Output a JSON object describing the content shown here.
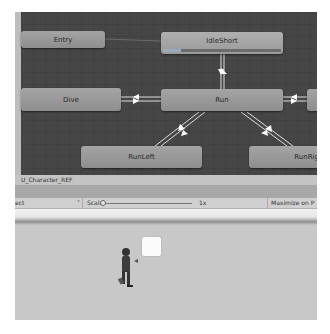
{
  "animator": {
    "nodes": [
      {
        "id": "entry",
        "label": "Entry"
      },
      {
        "id": "idle",
        "label": "IdleShort",
        "progress_pct": 15
      },
      {
        "id": "dive",
        "label": "Dive"
      },
      {
        "id": "run",
        "label": "Run"
      },
      {
        "id": "right_partial",
        "label": ""
      },
      {
        "id": "runleft",
        "label": "RunLeft"
      },
      {
        "id": "runright",
        "label": "RunRig"
      }
    ],
    "footer_path": "U_Character_REF"
  },
  "game_toolbar": {
    "aspect_label": "ect",
    "dropdown_arrow": "˅",
    "scale_label": "Scale",
    "scale_value": "1x",
    "maximize_label": "Maximize on P"
  },
  "scene": {
    "icons": [
      "character-sprite",
      "white-cube"
    ]
  },
  "colors": {
    "graph_bg": "#464646",
    "node": "#9a9a9a",
    "transition": "#e8e8e8"
  }
}
